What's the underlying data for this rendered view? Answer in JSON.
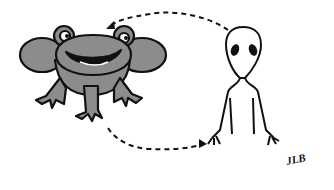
{
  "illustration": {
    "subjects": [
      "frog",
      "alien"
    ],
    "signature": "JLB",
    "colors": {
      "frog_fill": "#8c8c8c",
      "outline": "#111111",
      "background": "#ffffff"
    }
  }
}
